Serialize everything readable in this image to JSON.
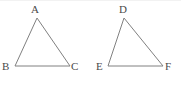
{
  "figure": {
    "background_color": "#ffffff",
    "stroke_color": "#808080",
    "label_color": "#4a4a4a",
    "stroke_width": 1,
    "width": 181,
    "height": 85
  },
  "shapes": [
    {
      "name": "triangle-abc",
      "kind": "triangle",
      "points": "37,18 15,66 70,66",
      "vertices": [
        {
          "label": "A",
          "x": 37,
          "y": 18,
          "label_x": 31,
          "label_y": 4
        },
        {
          "label": "B",
          "x": 15,
          "y": 66,
          "label_x": 2,
          "label_y": 61
        },
        {
          "label": "C",
          "x": 70,
          "y": 66,
          "label_x": 71,
          "label_y": 61
        }
      ]
    },
    {
      "name": "triangle-def",
      "kind": "triangle",
      "points": "124,18 108,66 163,66",
      "vertices": [
        {
          "label": "D",
          "x": 124,
          "y": 18,
          "label_x": 119,
          "label_y": 4
        },
        {
          "label": "E",
          "x": 108,
          "y": 66,
          "label_x": 96,
          "label_y": 61
        },
        {
          "label": "F",
          "x": 163,
          "y": 66,
          "label_x": 165,
          "label_y": 61
        }
      ]
    }
  ],
  "labels": {
    "a": "A",
    "b": "B",
    "c": "C",
    "d": "D",
    "e": "E",
    "f": "F"
  }
}
